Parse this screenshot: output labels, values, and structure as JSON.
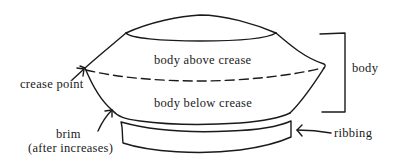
{
  "diagram": {
    "labels": {
      "body_above_crease": "body above crease",
      "body_below_crease": "body below crease",
      "crease_point": "crease point",
      "brim_line1": "brim",
      "brim_line2": "(after increases)",
      "body": "body",
      "ribbing": "ribbing"
    },
    "colors": {
      "stroke": "#1a1a1a",
      "background": "#ffffff"
    }
  }
}
